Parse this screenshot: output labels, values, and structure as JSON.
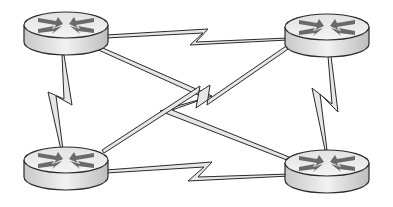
{
  "diagram": {
    "type": "network-topology",
    "colors": {
      "router_top": "#e8e8e8",
      "router_body": "#d6d6d6",
      "router_arrows": "#6a6a6a",
      "link_fill": "#e6e6e6",
      "outline": "#2a2a2a",
      "background": "#ffffff"
    },
    "nodes": [
      {
        "id": "router-top-left",
        "icon": "router-icon",
        "cx": 66,
        "cy": 25
      },
      {
        "id": "router-top-right",
        "icon": "router-icon",
        "cx": 327,
        "cy": 27
      },
      {
        "id": "router-bottom-left",
        "icon": "router-icon",
        "cx": 66,
        "cy": 160
      },
      {
        "id": "router-bottom-right",
        "icon": "router-icon",
        "cx": 327,
        "cy": 163
      }
    ],
    "links": [
      {
        "from": "router-top-left",
        "to": "router-top-right",
        "type": "serial"
      },
      {
        "from": "router-bottom-left",
        "to": "router-bottom-right",
        "type": "serial"
      },
      {
        "from": "router-top-left",
        "to": "router-bottom-left",
        "type": "serial"
      },
      {
        "from": "router-top-right",
        "to": "router-bottom-right",
        "type": "serial"
      },
      {
        "from": "router-top-left",
        "to": "router-bottom-right",
        "type": "serial"
      },
      {
        "from": "router-top-right",
        "to": "router-bottom-left",
        "type": "serial"
      }
    ]
  }
}
